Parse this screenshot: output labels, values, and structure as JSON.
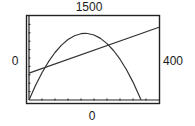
{
  "window": {
    "ymax_label": "1500",
    "ymin_label": "0",
    "xmin_label": "0",
    "xmax_label": "400"
  },
  "colors": {
    "frame": "#222222",
    "curve": "#333333",
    "background": "#ffffff"
  },
  "chart_data": {
    "type": "line",
    "title": "",
    "xlabel": "",
    "ylabel": "",
    "xlim": [
      0,
      400
    ],
    "ylim": [
      0,
      1500
    ],
    "xscl": 40,
    "yscl": 150,
    "grid": false,
    "legend": null,
    "series": [
      {
        "name": "parabola",
        "x": [
          0,
          20,
          40,
          60,
          80,
          100,
          120,
          140,
          160,
          172.5,
          180,
          200,
          220,
          240,
          260,
          280,
          300,
          320,
          345
        ],
        "values": [
          0,
          260,
          488,
          684,
          848,
          980,
          1080,
          1148,
          1184,
          1190,
          1188,
          1160,
          1100,
          1008,
          884,
          728,
          540,
          320,
          0
        ]
      },
      {
        "name": "line",
        "x": [
          0,
          400
        ],
        "values": [
          480,
          1300
        ]
      }
    ]
  }
}
